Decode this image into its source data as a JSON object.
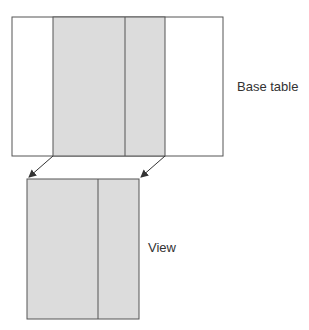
{
  "diagram": {
    "base_table": {
      "label": "Base table",
      "columns": 4,
      "selected_columns": [
        2,
        3
      ]
    },
    "view": {
      "label": "View",
      "columns": 2
    },
    "colors": {
      "fill": "#dcdcdc",
      "stroke": "#555555",
      "text": "#333333"
    }
  }
}
